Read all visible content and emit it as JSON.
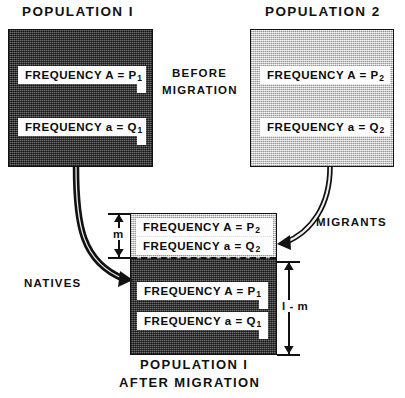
{
  "figure": {
    "title_pop1": "POPULATION I",
    "title_pop2": "POPULATION 2",
    "center_note_line1": "BEFORE",
    "center_note_line2": "MIGRATION",
    "natives_label": "NATIVES",
    "migrants_label": "MIGRANTS",
    "result_caption_line1": "POPULATION I",
    "result_caption_line2": "AFTER MIGRATION"
  },
  "population1": {
    "fill": "#4a4a4a",
    "labels": [
      {
        "text": "FREQUENCY A = P",
        "sub": "1"
      },
      {
        "text": "FREQUENCY a = Q",
        "sub": "1"
      }
    ]
  },
  "population2": {
    "fill": "#d2d2d2",
    "labels": [
      {
        "text": "FREQUENCY A = P",
        "sub": "2"
      },
      {
        "text": "FREQUENCY a = Q",
        "sub": "2"
      }
    ]
  },
  "result_box": {
    "migrant_section": {
      "fill": "#d2d2d2",
      "labels": [
        {
          "text": "FREQUENCY A = P",
          "sub": "2"
        },
        {
          "text": "FREQUENCY a = Q",
          "sub": "2"
        }
      ]
    },
    "native_section": {
      "fill": "#4a4a4a",
      "labels": [
        {
          "text": "FREQUENCY A = P",
          "sub": "1"
        },
        {
          "text": "FREQUENCY a = Q",
          "sub": "1"
        }
      ]
    },
    "dimensions": {
      "migrant_fraction": "m",
      "native_fraction": "l - m"
    }
  },
  "colors": {
    "ink": "#111111",
    "page": "#ffffff",
    "dark_population": "#4a4a4a",
    "light_population": "#d2d2d2",
    "label_plate": "#fdfdfd"
  }
}
